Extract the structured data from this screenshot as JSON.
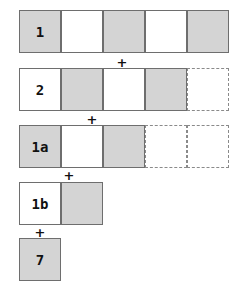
{
  "diagram": {
    "rows": [
      {
        "label": "1",
        "top": 10,
        "cells": [
          "shaded",
          "white",
          "shaded",
          "white",
          "shaded"
        ]
      },
      {
        "label": "2",
        "top": 68,
        "cells": [
          "white",
          "shaded",
          "white",
          "shaded",
          "dashed"
        ]
      },
      {
        "label": "1a",
        "top": 125,
        "cells": [
          "shaded",
          "white",
          "shaded",
          "dashed",
          "dashed"
        ]
      },
      {
        "label": "1b",
        "top": 182,
        "cells": [
          "white",
          "shaded"
        ]
      },
      {
        "label": "7",
        "top": 238,
        "cells": [
          "shaded"
        ]
      }
    ],
    "operators": [
      {
        "symbol": "+",
        "x": 122,
        "y": 62
      },
      {
        "symbol": "+",
        "x": 92,
        "y": 119
      },
      {
        "symbol": "+",
        "x": 69,
        "y": 175
      },
      {
        "symbol": "+",
        "x": 40,
        "y": 232
      }
    ],
    "colors": {
      "shaded": "#d4d4d4",
      "border": "#6e6e6e"
    }
  }
}
